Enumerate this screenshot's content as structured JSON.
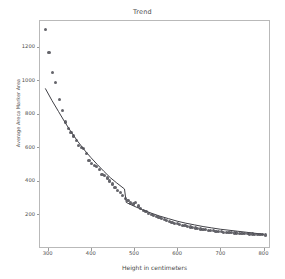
{
  "chart_data": {
    "type": "scatter",
    "title": "Trend",
    "xlabel": "Height in centimeters",
    "ylabel": "Average Areca Marker Area",
    "xlim": [
      280,
      815
    ],
    "ylim": [
      0,
      1360
    ],
    "xticks": [
      300,
      400,
      500,
      600,
      700,
      800
    ],
    "yticks": [
      200,
      400,
      600,
      800,
      1000,
      1200
    ],
    "grid": false,
    "legend": null,
    "series": [
      {
        "name": "Observations",
        "type": "scatter",
        "marker": "circle",
        "color": "#4f4f55",
        "x": [
          295,
          303,
          311,
          319,
          327,
          334,
          341,
          348,
          354,
          360,
          366,
          372,
          378,
          384,
          390,
          396,
          402,
          408,
          414,
          420,
          426,
          432,
          438,
          444,
          450,
          456,
          462,
          468,
          474,
          480,
          486,
          492,
          498,
          504,
          510,
          516,
          522,
          528,
          534,
          540,
          546,
          552,
          558,
          564,
          570,
          576,
          582,
          588,
          594,
          600,
          606,
          612,
          618,
          624,
          630,
          636,
          642,
          648,
          654,
          660,
          666,
          672,
          678,
          684,
          690,
          696,
          702,
          708,
          714,
          720,
          726,
          732,
          738,
          744,
          750,
          756,
          762,
          768,
          774,
          780,
          786,
          792,
          798,
          804
        ],
        "y": [
          1305,
          1168,
          1048,
          985,
          885,
          820,
          752,
          715,
          690,
          668,
          640,
          612,
          600,
          592,
          565,
          520,
          505,
          492,
          486,
          470,
          440,
          432,
          418,
          400,
          382,
          360,
          345,
          330,
          312,
          296,
          282,
          268,
          262,
          272,
          250,
          238,
          226,
          216,
          208,
          200,
          192,
          186,
          180,
          174,
          168,
          162,
          158,
          152,
          148,
          144,
          140,
          136,
          132,
          128,
          125,
          122,
          119,
          116,
          113,
          110,
          108,
          106,
          104,
          102,
          100,
          98,
          96,
          94,
          93,
          92,
          91,
          90,
          89,
          88,
          87,
          86,
          85,
          84,
          83,
          82,
          81,
          80,
          79,
          78
        ]
      },
      {
        "name": "Trend line",
        "type": "line",
        "color": "#404046",
        "x": [
          295,
          310,
          325,
          340,
          355,
          370,
          385,
          400,
          415,
          430,
          445,
          460,
          470,
          478,
          482,
          490,
          505,
          520,
          540,
          560,
          580,
          600,
          620,
          640,
          660,
          680,
          700,
          720,
          740,
          760,
          780,
          800
        ],
        "y": [
          950,
          880,
          815,
          750,
          690,
          635,
          585,
          540,
          498,
          458,
          420,
          388,
          368,
          352,
          272,
          262,
          244,
          228,
          208,
          190,
          175,
          160,
          148,
          138,
          128,
          120,
          112,
          106,
          100,
          94,
          88,
          82
        ]
      }
    ]
  }
}
